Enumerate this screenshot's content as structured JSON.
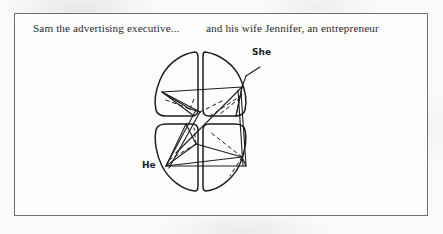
{
  "page": {
    "background_color": "#fbfbfa",
    "frame_color": "#6e6e70",
    "ink_color": "#1d1d1f"
  },
  "caption": {
    "left_text": "Sam the advertising executive...",
    "right_text": "and his wife Jennifer, an entrepreneur"
  },
  "figure": {
    "labels": {
      "upper_right": "She",
      "lower_left": "He"
    },
    "quadrants": [
      {
        "name": "upper-left"
      },
      {
        "name": "upper-right"
      },
      {
        "name": "lower-left"
      },
      {
        "name": "lower-right"
      }
    ],
    "line_styles": [
      "solid",
      "dashed"
    ]
  }
}
